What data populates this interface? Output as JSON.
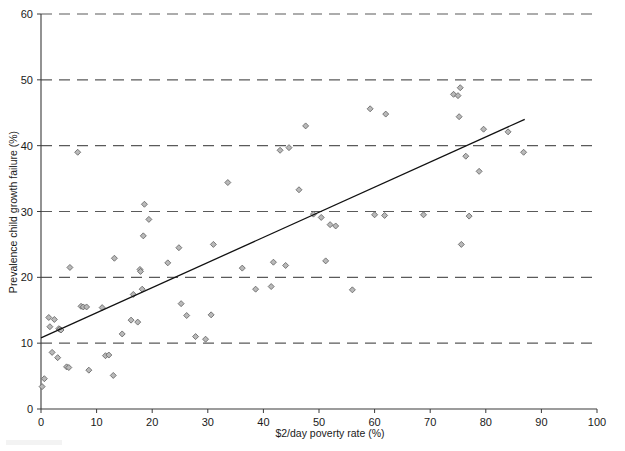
{
  "chart_data": {
    "type": "scatter",
    "title": "",
    "xlabel": "$2/day poverty rate (%)",
    "ylabel": "Prevalence child growth failure (%)",
    "xlim": [
      0,
      100
    ],
    "ylim": [
      0,
      60
    ],
    "xticks": [
      0,
      10,
      20,
      30,
      40,
      50,
      60,
      70,
      80,
      90,
      100
    ],
    "yticks": [
      0,
      10,
      20,
      30,
      40,
      50,
      60
    ],
    "xtick_labels": [
      "0",
      "10",
      "20",
      "30",
      "40",
      "50",
      "60",
      "70",
      "80",
      "90",
      "100"
    ],
    "ytick_labels": [
      "0",
      "10",
      "20",
      "30",
      "40",
      "50",
      "60"
    ],
    "grid": "horizontal-dashed",
    "legend": "none",
    "marker": "diamond",
    "marker_color": "#b9b9b9",
    "marker_edge_color": "#5e5e5e",
    "trend_line": {
      "label": "linear fit",
      "color": "#111111",
      "x": [
        0,
        87
      ],
      "y": [
        10.8,
        44.0
      ]
    },
    "points": [
      [
        0.2,
        3.4
      ],
      [
        0.6,
        4.6
      ],
      [
        1.4,
        13.9
      ],
      [
        1.6,
        12.5
      ],
      [
        2.0,
        8.6
      ],
      [
        2.4,
        13.6
      ],
      [
        3.0,
        7.8
      ],
      [
        3.2,
        12.2
      ],
      [
        3.4,
        12.1
      ],
      [
        3.6,
        12.0
      ],
      [
        4.6,
        6.4
      ],
      [
        5.0,
        6.3
      ],
      [
        5.2,
        21.5
      ],
      [
        6.6,
        39.0
      ],
      [
        7.2,
        15.6
      ],
      [
        7.6,
        15.5
      ],
      [
        8.2,
        15.5
      ],
      [
        8.6,
        5.9
      ],
      [
        11.0,
        15.4
      ],
      [
        11.6,
        8.1
      ],
      [
        12.2,
        8.2
      ],
      [
        13.0,
        5.1
      ],
      [
        13.2,
        22.9
      ],
      [
        14.6,
        11.4
      ],
      [
        16.2,
        13.5
      ],
      [
        16.6,
        17.4
      ],
      [
        17.4,
        13.2
      ],
      [
        17.8,
        21.2
      ],
      [
        17.9,
        20.9
      ],
      [
        18.2,
        18.2
      ],
      [
        18.4,
        26.3
      ],
      [
        18.6,
        31.1
      ],
      [
        19.4,
        28.8
      ],
      [
        22.8,
        22.2
      ],
      [
        24.8,
        24.5
      ],
      [
        25.2,
        16.0
      ],
      [
        26.2,
        14.2
      ],
      [
        27.8,
        11.0
      ],
      [
        29.6,
        10.6
      ],
      [
        30.6,
        14.3
      ],
      [
        31.0,
        25.0
      ],
      [
        33.6,
        34.4
      ],
      [
        36.2,
        21.4
      ],
      [
        38.6,
        18.2
      ],
      [
        41.4,
        18.6
      ],
      [
        41.8,
        22.3
      ],
      [
        43.0,
        39.3
      ],
      [
        44.0,
        21.8
      ],
      [
        44.6,
        39.7
      ],
      [
        46.4,
        33.3
      ],
      [
        47.6,
        43.0
      ],
      [
        49.0,
        29.6
      ],
      [
        50.4,
        29.1
      ],
      [
        51.2,
        22.5
      ],
      [
        52.0,
        28.0
      ],
      [
        53.0,
        27.8
      ],
      [
        56.0,
        18.1
      ],
      [
        59.2,
        45.6
      ],
      [
        60.0,
        29.5
      ],
      [
        61.8,
        29.4
      ],
      [
        62.0,
        44.8
      ],
      [
        68.8,
        29.5
      ],
      [
        74.2,
        47.8
      ],
      [
        75.0,
        47.6
      ],
      [
        75.2,
        44.4
      ],
      [
        75.4,
        48.8
      ],
      [
        75.6,
        25.0
      ],
      [
        76.4,
        38.4
      ],
      [
        77.0,
        29.3
      ],
      [
        78.8,
        36.1
      ],
      [
        79.6,
        42.5
      ],
      [
        84.0,
        42.1
      ],
      [
        86.8,
        39.0
      ]
    ]
  }
}
